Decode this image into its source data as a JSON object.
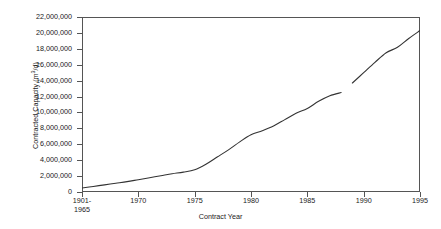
{
  "chart_data": {
    "type": "line",
    "title": "",
    "xlabel": "Contract Year",
    "ylabel_text": "Contracted Capacity (m",
    "ylabel_sup": "3",
    "ylabel_tail": "/d)",
    "ylabel_full": "Contracted Capacity (m3/d)",
    "ylim": [
      0,
      22000000
    ],
    "ytick_labels": [
      "22,000,000",
      "20,000,000",
      "18,000,000",
      "16,000,000",
      "14,000,000",
      "12,000,000",
      "10,000,000",
      "8,000,000",
      "6,000,000",
      "4,000,000",
      "2,000,000",
      "0"
    ],
    "ytick_values": [
      22000000,
      20000000,
      18000000,
      16000000,
      14000000,
      12000000,
      10000000,
      8000000,
      6000000,
      4000000,
      2000000,
      0
    ],
    "xtick_labels": [
      [
        "1901-",
        "1965"
      ],
      [
        "1970"
      ],
      [
        "1975"
      ],
      [
        "1980"
      ],
      [
        "1985"
      ],
      [
        "1990"
      ],
      [
        "1995"
      ]
    ],
    "xtick_values": [
      1965,
      1970,
      1975,
      1980,
      1985,
      1990,
      1995
    ],
    "xlim": [
      1965,
      1995
    ],
    "grid": false,
    "legend": false,
    "line_color": "#333333",
    "axis_color": "#555555",
    "note": "cumulative curve with a small break near 1988",
    "x": [
      1965,
      1966,
      1967,
      1968,
      1969,
      1970,
      1971,
      1972,
      1973,
      1974,
      1975,
      1976,
      1977,
      1978,
      1979,
      1980,
      1981,
      1982,
      1983,
      1984,
      1985,
      1986,
      1987,
      1988,
      1989,
      1990,
      1991,
      1992,
      1993,
      1994,
      1995
    ],
    "values": [
      500000,
      700000,
      900000,
      1100000,
      1300000,
      1550000,
      1800000,
      2050000,
      2300000,
      2500000,
      2800000,
      3500000,
      4400000,
      5300000,
      6300000,
      7200000,
      7700000,
      8300000,
      9100000,
      9900000,
      10500000,
      11400000,
      12100000,
      12500000,
      13700000,
      15000000,
      16300000,
      17500000,
      18200000,
      19300000,
      20300000
    ],
    "series": [
      {
        "name": "Contracted Capacity",
        "values": [
          500000,
          700000,
          900000,
          1100000,
          1300000,
          1550000,
          1800000,
          2050000,
          2300000,
          2500000,
          2800000,
          3500000,
          4400000,
          5300000,
          6300000,
          7200000,
          7700000,
          8300000,
          9100000,
          9900000,
          10500000,
          11400000,
          12100000,
          12500000,
          13700000,
          15000000,
          16300000,
          17500000,
          18200000,
          19300000,
          20300000
        ]
      }
    ],
    "break_at_x": 1988.3
  }
}
